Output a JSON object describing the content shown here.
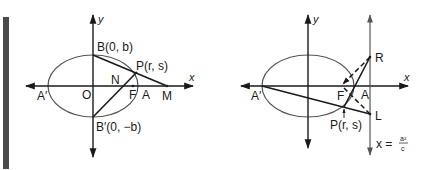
{
  "figure": {
    "left": {
      "axis_labels": {
        "x": "x",
        "y": "y"
      },
      "points": {
        "B": "B(0, b)",
        "B_prime": "B′(0, −b)",
        "P": "P(r, s)",
        "N": "N",
        "F": "F",
        "A": "A",
        "M": "M",
        "O": "O",
        "A_prime": "A′"
      }
    },
    "right": {
      "axis_labels": {
        "x": "x",
        "y": "y"
      },
      "points": {
        "R": "R",
        "L": "L",
        "F": "F",
        "A": "A",
        "A_prime": "A′",
        "P": "P(r, s)"
      },
      "directrix": {
        "lhs": "x =",
        "numerator": "a²",
        "denominator": "c"
      }
    },
    "colors": {
      "ink": "#1a1a1a",
      "ellipse": "#555555",
      "sidebar": "#4a4a4a"
    }
  }
}
